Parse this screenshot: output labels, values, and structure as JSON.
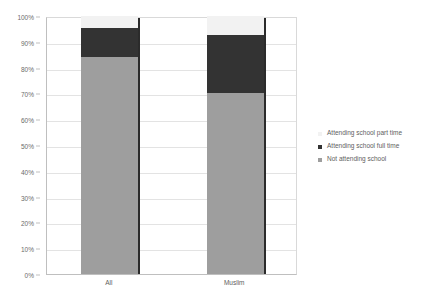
{
  "chart_data": {
    "type": "bar",
    "subtype": "stacked-100-percent",
    "title": "",
    "xlabel": "",
    "ylabel": "",
    "categories": [
      "All",
      "Muslim"
    ],
    "series": [
      {
        "name": "Not attending school",
        "color": "#9e9e9e",
        "values": [
          84.0,
          70.0
        ]
      },
      {
        "name": "Attending school full time",
        "color": "#333333",
        "values": [
          11.5,
          22.5
        ]
      },
      {
        "name": "Attending school part time",
        "color": "#f2f2f2",
        "values": [
          4.5,
          7.5
        ]
      }
    ],
    "ylim": [
      0,
      100
    ],
    "y_ticks": [
      0,
      10,
      20,
      30,
      40,
      50,
      60,
      70,
      80,
      90,
      100
    ],
    "y_tick_labels": [
      "0%",
      "10%",
      "20%",
      "30%",
      "40%",
      "50%",
      "60%",
      "70%",
      "80%",
      "90%",
      "100%"
    ],
    "grid": true,
    "grid_axis": "y",
    "legend_position": "right",
    "legend_order": [
      "Attending school part time",
      "Attending school full time",
      "Not attending school"
    ]
  },
  "legend": {
    "items": [
      {
        "label": "Attending school part time",
        "swatch": "parttime"
      },
      {
        "label": "Attending school full time",
        "swatch": "fulltime"
      },
      {
        "label": "Not attending school",
        "swatch": "notattending"
      }
    ]
  },
  "colors": {
    "not_attending": "#9e9e9e",
    "full_time": "#333333",
    "part_time": "#f2f2f2",
    "gridline": "#e3e3e3",
    "axis": "#bfbfbf",
    "text": "#5e5e5e",
    "bar_edge": "#2b2b2b",
    "background": "#ffffff"
  }
}
